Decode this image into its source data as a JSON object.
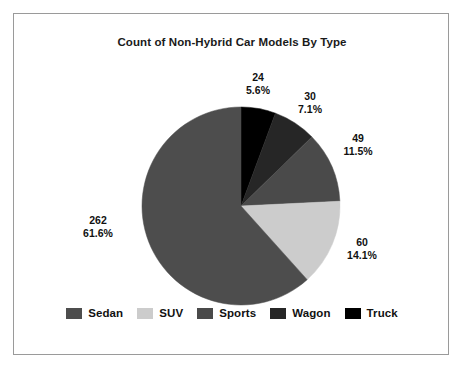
{
  "chart_data": {
    "type": "pie",
    "title": "Count of Non-Hybrid Car Models By Type",
    "categories": [
      "Sedan",
      "SUV",
      "Sports",
      "Wagon",
      "Truck"
    ],
    "values": [
      262,
      60,
      49,
      30,
      24
    ],
    "percents": [
      "61.6%",
      "14.1%",
      "11.5%",
      "7.1%",
      "5.6%"
    ],
    "total": 425,
    "colors": [
      "#4d4d4d",
      "#cccccc",
      "#4a4a4a",
      "#262626",
      "#000000"
    ],
    "legend_position": "bottom",
    "grid": false,
    "start_angle_deg": 0,
    "direction": "clockwise",
    "slices": [
      {
        "label": "Truck",
        "value": 24,
        "percent": "5.6%",
        "color": "#000000",
        "start_deg": 0.0,
        "sweep_deg": 20.33
      },
      {
        "label": "Wagon",
        "value": 30,
        "percent": "7.1%",
        "color": "#262626",
        "start_deg": 20.33,
        "sweep_deg": 25.41
      },
      {
        "label": "Sports",
        "value": 49,
        "percent": "11.5%",
        "color": "#4a4a4a",
        "start_deg": 45.74,
        "sweep_deg": 41.5
      },
      {
        "label": "SUV",
        "value": 60,
        "percent": "14.1%",
        "color": "#cccccc",
        "start_deg": 87.24,
        "sweep_deg": 50.82
      },
      {
        "label": "Sedan",
        "value": 262,
        "percent": "61.6%",
        "color": "#4d4d4d",
        "start_deg": 138.06,
        "sweep_deg": 221.94
      }
    ],
    "labels": [
      {
        "name": "truck",
        "value": "24",
        "percent": "5.6%"
      },
      {
        "name": "wagon",
        "value": "30",
        "percent": "7.1%"
      },
      {
        "name": "sports",
        "value": "49",
        "percent": "11.5%"
      },
      {
        "name": "suv",
        "value": "60",
        "percent": "14.1%"
      },
      {
        "name": "sedan",
        "value": "262",
        "percent": "61.6%"
      }
    ]
  },
  "legend": {
    "items": [
      {
        "label": "Sedan",
        "color": "#4d4d4d"
      },
      {
        "label": "SUV",
        "color": "#cccccc"
      },
      {
        "label": "Sports",
        "color": "#4a4a4a"
      },
      {
        "label": "Wagon",
        "color": "#262626"
      },
      {
        "label": "Truck",
        "color": "#000000"
      }
    ]
  }
}
